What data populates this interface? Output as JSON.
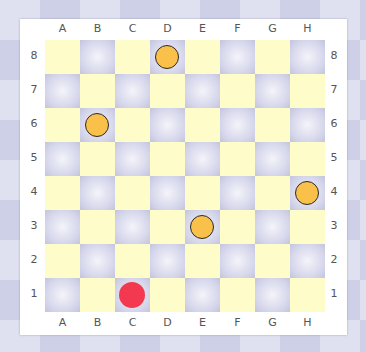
{
  "board": {
    "files": [
      "A",
      "B",
      "C",
      "D",
      "E",
      "F",
      "G",
      "H"
    ],
    "ranks": [
      "8",
      "7",
      "6",
      "5",
      "4",
      "3",
      "2",
      "1"
    ],
    "colors": {
      "light": "#fefcc8",
      "dark": "#d4d5ea",
      "yellow_piece": "#f9c04a",
      "red_piece": "#f2394f"
    },
    "pieces": [
      {
        "square": "D8",
        "color": "yellow"
      },
      {
        "square": "B6",
        "color": "yellow"
      },
      {
        "square": "H4",
        "color": "yellow"
      },
      {
        "square": "E3",
        "color": "yellow"
      },
      {
        "square": "C1",
        "color": "red"
      }
    ]
  }
}
